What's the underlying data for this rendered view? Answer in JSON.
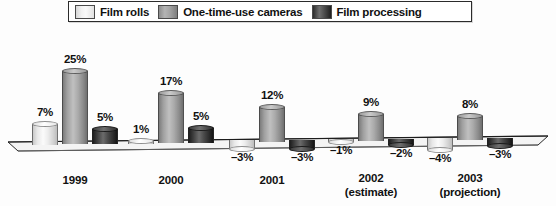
{
  "legend": {
    "items": [
      {
        "label": "Film rolls",
        "swatch": "light-gray-swatch-icon",
        "color": "#f0f0f0"
      },
      {
        "label": "One-time-use cameras",
        "swatch": "medium-gray-swatch-icon",
        "color": "#a6a6a6"
      },
      {
        "label": "Film processing",
        "swatch": "dark-gray-swatch-icon",
        "color": "#3a3a3a"
      }
    ]
  },
  "chart_data": {
    "type": "bar",
    "title": "",
    "subtitle": "",
    "xlabel": "",
    "ylabel": "",
    "grid": false,
    "legend_position": "top",
    "ylim": [
      -5,
      27
    ],
    "categories": [
      "1999",
      "2000",
      "2001",
      "2002",
      "2003"
    ],
    "category_sublabels": [
      "",
      "",
      "",
      "(estimate)",
      "(projection)"
    ],
    "series": [
      {
        "name": "Film rolls",
        "color": "#f0f0f0",
        "values": [
          7,
          1,
          -3,
          -1,
          -4
        ]
      },
      {
        "name": "One-time-use cameras",
        "color": "#a6a6a6",
        "values": [
          25,
          17,
          12,
          9,
          8
        ]
      },
      {
        "name": "Film processing",
        "color": "#3a3a3a",
        "values": [
          5,
          5,
          -3,
          -2,
          -3
        ]
      }
    ],
    "value_labels": [
      [
        "7%",
        "25%",
        "5%"
      ],
      [
        "1%",
        "17%",
        "5%"
      ],
      [
        "–3%",
        "12%",
        "–3%"
      ],
      [
        "–1%",
        "9%",
        "–2%"
      ],
      [
        "–4%",
        "8%",
        "–3%"
      ]
    ]
  },
  "axis": {
    "groups": [
      {
        "year": "1999",
        "sub": ""
      },
      {
        "year": "2000",
        "sub": ""
      },
      {
        "year": "2001",
        "sub": ""
      },
      {
        "year": "2002",
        "sub": "(estimate)"
      },
      {
        "year": "2003",
        "sub": "(projection)"
      }
    ]
  }
}
